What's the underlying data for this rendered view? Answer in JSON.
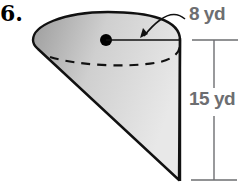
{
  "problem": {
    "number": "6."
  },
  "figure": {
    "shape": "cone",
    "colors": {
      "fill_light": "#e6e6e6",
      "fill_dark": "#9a9a9a",
      "outline": "#111111",
      "label": "#6d6e71"
    },
    "labels": {
      "radius": "8 yd",
      "height": "15 yd"
    }
  }
}
